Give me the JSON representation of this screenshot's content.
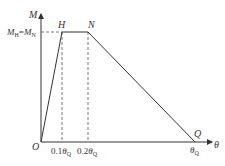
{
  "diagram": {
    "axes": {
      "y_label": "M",
      "x_label": "θ",
      "origin_label": "O"
    },
    "points": {
      "H": "H",
      "N": "N",
      "Q": "Q"
    },
    "y_tick_label": {
      "left": "M",
      "left_sub": "H",
      "eq": "=",
      "right": "M",
      "right_sub": "N"
    },
    "x_tick_labels": [
      {
        "coef": "0.1",
        "sym": "θ",
        "sub": "Q"
      },
      {
        "coef": "0.2",
        "sym": "θ",
        "sub": "Q"
      },
      {
        "coef": "",
        "sym": "θ",
        "sub": "Q"
      }
    ],
    "colors": {
      "line": "#333333",
      "dashed": "#555555"
    }
  }
}
